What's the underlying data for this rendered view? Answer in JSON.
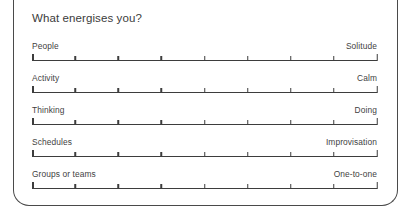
{
  "worksheet": {
    "title": "What energises you?",
    "scale": {
      "divisions": 8,
      "tick_count": 9
    },
    "rows": [
      {
        "left_label": "People",
        "right_label": "Solitude"
      },
      {
        "left_label": "Activity",
        "right_label": "Calm"
      },
      {
        "left_label": "Thinking",
        "right_label": "Doing"
      },
      {
        "left_label": "Schedules",
        "right_label": "Improvisation"
      },
      {
        "left_label": "Groups or teams",
        "right_label": "One-to-one"
      }
    ]
  },
  "colors": {
    "border": "#4a4a4a",
    "text": "#3b3b3b",
    "line": "#3d3d3d",
    "background": "#ffffff"
  }
}
